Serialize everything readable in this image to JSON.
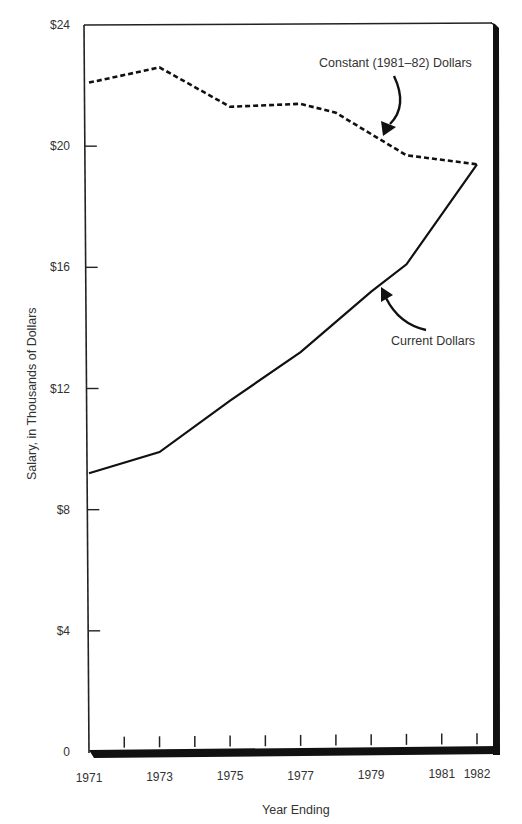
{
  "chart_data": {
    "type": "line",
    "title": "",
    "xlabel": "Year Ending",
    "ylabel": "Salary, in Thousands of Dollars",
    "x": [
      1971,
      1972,
      1973,
      1974,
      1975,
      1976,
      1977,
      1978,
      1979,
      1980,
      1981,
      1982
    ],
    "x_tick_labels": [
      "1971",
      "1973",
      "1975",
      "1977",
      "1979",
      "1981",
      "1982"
    ],
    "y_tick_labels": [
      "0",
      "$4",
      "$8",
      "$12",
      "$16",
      "$20",
      "$24"
    ],
    "y_ticks": [
      0,
      4,
      8,
      12,
      16,
      20,
      24
    ],
    "ylim": [
      0,
      24
    ],
    "xlim": [
      1971,
      1982
    ],
    "grid": false,
    "legend_position": "inline annotations",
    "series": [
      {
        "name": "Constant (1981–82) Dollars",
        "style": "dashed",
        "points": [
          {
            "x": 1971,
            "y": 22.1
          },
          {
            "x": 1973,
            "y": 22.6
          },
          {
            "x": 1975,
            "y": 21.3
          },
          {
            "x": 1977,
            "y": 21.4
          },
          {
            "x": 1978,
            "y": 21.1
          },
          {
            "x": 1979,
            "y": 20.4
          },
          {
            "x": 1980,
            "y": 19.7
          },
          {
            "x": 1982,
            "y": 19.4
          }
        ]
      },
      {
        "name": "Current Dollars",
        "style": "solid",
        "points": [
          {
            "x": 1971,
            "y": 9.2
          },
          {
            "x": 1973,
            "y": 9.9
          },
          {
            "x": 1975,
            "y": 11.6
          },
          {
            "x": 1977,
            "y": 13.2
          },
          {
            "x": 1978,
            "y": 14.2
          },
          {
            "x": 1979,
            "y": 15.2
          },
          {
            "x": 1980,
            "y": 16.1
          },
          {
            "x": 1982,
            "y": 19.4
          }
        ]
      }
    ],
    "annotations": [
      {
        "text": "Constant (1981–82) Dollars",
        "target_series": "Constant (1981–82) Dollars"
      },
      {
        "text": "Current Dollars",
        "target_series": "Current Dollars"
      }
    ]
  },
  "labels": {
    "xlabel": "Year Ending",
    "ylabel": "Salary, in Thousands of Dollars",
    "constant_annotation": "Constant (1981–82) Dollars",
    "current_annotation": "Current Dollars"
  },
  "colors": {
    "line": "#111111",
    "text": "#333333",
    "background": "#ffffff"
  }
}
